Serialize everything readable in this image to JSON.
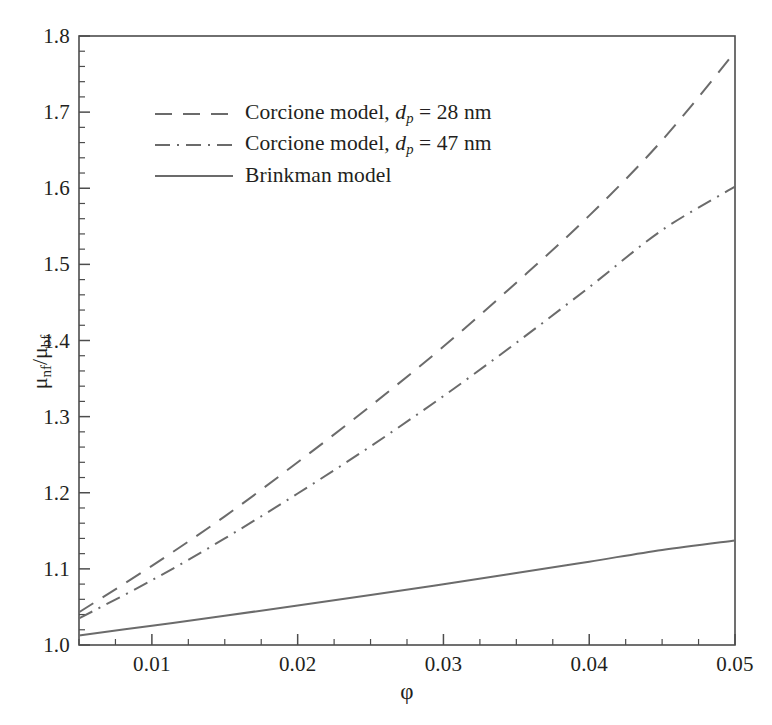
{
  "chart_data": {
    "type": "line",
    "title": "",
    "xlabel": "φ",
    "ylabel": "μ_nf/μ_bf",
    "xlim": [
      0.005,
      0.05
    ],
    "ylim": [
      1.0,
      1.8
    ],
    "grid": false,
    "legend_position": "upper-left",
    "x": [
      0.005,
      0.01,
      0.015,
      0.02,
      0.025,
      0.03,
      0.035,
      0.04,
      0.045,
      0.05
    ],
    "series": [
      {
        "name": "Corcione model, d_p = 28 nm",
        "style": "dashed",
        "color": "#6b6b6b",
        "values": [
          1.043,
          1.104,
          1.169,
          1.24,
          1.314,
          1.392,
          1.476,
          1.564,
          1.663,
          1.779
        ]
      },
      {
        "name": "Corcione model, d_p = 47 nm",
        "style": "dash-dot",
        "color": "#6b6b6b",
        "values": [
          1.035,
          1.085,
          1.14,
          1.199,
          1.261,
          1.327,
          1.397,
          1.47,
          1.545,
          1.602
        ]
      },
      {
        "name": "Brinkman model",
        "style": "solid",
        "color": "#6b6b6b",
        "values": [
          1.0125,
          1.0253,
          1.0384,
          1.0519,
          1.0657,
          1.0799,
          1.0945,
          1.1095,
          1.1249,
          1.1374
        ]
      }
    ],
    "x_ticks": [
      {
        "value": 0.01,
        "label": "0.01"
      },
      {
        "value": 0.02,
        "label": "0.02"
      },
      {
        "value": 0.03,
        "label": "0.03"
      },
      {
        "value": 0.04,
        "label": "0.04"
      },
      {
        "value": 0.05,
        "label": "0.05"
      }
    ],
    "x_minor_step": 0.0025,
    "y_ticks": [
      {
        "value": 1.8,
        "label": "1.8"
      },
      {
        "value": 1.7,
        "label": "1.7"
      },
      {
        "value": 1.6,
        "label": "1.6"
      },
      {
        "value": 1.5,
        "label": "1.5"
      },
      {
        "value": 1.4,
        "label": "1.4"
      },
      {
        "value": 1.3,
        "label": "1.3"
      },
      {
        "value": 1.2,
        "label": "1.2"
      },
      {
        "value": 1.1,
        "label": "1.1"
      },
      {
        "value": 1.0,
        "label": "1.0"
      }
    ],
    "y_minor_step": 0.02
  },
  "axes": {
    "y_title_main": "μ",
    "y_title_sub1": "nf",
    "y_title_slash": "/μ",
    "y_title_sub2": "bf",
    "x_title": "φ"
  },
  "legend": {
    "items": [
      {
        "prefix": "Corcione model, ",
        "symbol": "d",
        "subscript": "p",
        "suffix": " = 28 nm",
        "style": "dashed",
        "swatch": "dashed-line-icon"
      },
      {
        "prefix": "Corcione model, ",
        "symbol": "d",
        "subscript": "p",
        "suffix": " = 47 nm",
        "style": "dash-dot",
        "swatch": "dash-dot-line-icon"
      },
      {
        "prefix": "Brinkman model",
        "symbol": "",
        "subscript": "",
        "suffix": "",
        "style": "solid",
        "swatch": "solid-line-icon"
      }
    ]
  },
  "colors": {
    "line": "#6b6b6b",
    "axis": "#4d4d4d",
    "text": "#231f20",
    "background": "#ffffff"
  }
}
